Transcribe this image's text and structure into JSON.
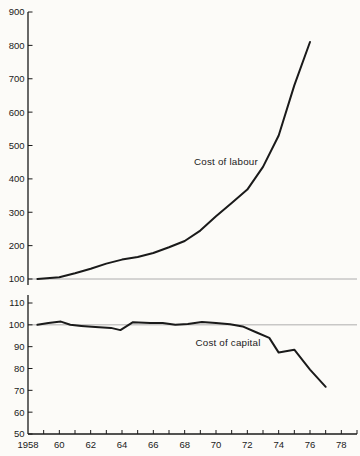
{
  "figure": {
    "background_color": "#fcfbf8",
    "line_color": "#1a1a1a",
    "reference_line_color": "#9b9b9b",
    "text_color": "#1a1a1a"
  },
  "chart_data": [
    {
      "type": "line",
      "panel": "top",
      "series_label": "Cost of labour",
      "ylim": [
        100,
        900
      ],
      "yticks": [
        100,
        200,
        300,
        400,
        500,
        600,
        700,
        800,
        900
      ],
      "reference_line": 100,
      "points": [
        [
          1958.6,
          100
        ],
        [
          1960,
          105
        ],
        [
          1961,
          117
        ],
        [
          1962,
          131
        ],
        [
          1963,
          146
        ],
        [
          1964,
          158
        ],
        [
          1965,
          166
        ],
        [
          1966,
          178
        ],
        [
          1967,
          195
        ],
        [
          1968,
          214
        ],
        [
          1969,
          245
        ],
        [
          1970,
          288
        ],
        [
          1971,
          328
        ],
        [
          1972,
          368
        ],
        [
          1973,
          436
        ],
        [
          1974,
          530
        ],
        [
          1975,
          680
        ],
        [
          1976,
          810
        ]
      ]
    },
    {
      "type": "line",
      "panel": "bottom",
      "series_label": "Cost of capital",
      "ylim": [
        50,
        110
      ],
      "yticks": [
        50,
        60,
        70,
        80,
        90,
        100,
        110
      ],
      "reference_line": 100,
      "points": [
        [
          1958.6,
          100
        ],
        [
          1959.3,
          100.8
        ],
        [
          1960.1,
          101.5
        ],
        [
          1960.7,
          100
        ],
        [
          1961.4,
          99.5
        ],
        [
          1962.3,
          99
        ],
        [
          1963.3,
          98.6
        ],
        [
          1963.9,
          97.6
        ],
        [
          1964.7,
          101.2
        ],
        [
          1965.8,
          100.8
        ],
        [
          1966.6,
          100.8
        ],
        [
          1967.4,
          100
        ],
        [
          1968.2,
          100.4
        ],
        [
          1969.1,
          101.3
        ],
        [
          1970,
          100.8
        ],
        [
          1970.9,
          100.3
        ],
        [
          1971.7,
          99.3
        ],
        [
          1972.6,
          96.5
        ],
        [
          1973.4,
          94
        ],
        [
          1974,
          87.3
        ],
        [
          1975,
          88.6
        ],
        [
          1976,
          79.5
        ],
        [
          1977,
          71.6
        ]
      ]
    }
  ],
  "x_axis": {
    "range": [
      1958,
      1979
    ],
    "tick_interval": 1,
    "labels": [
      {
        "text": "1958",
        "year": 1958
      },
      {
        "text": "60",
        "year": 1960
      },
      {
        "text": "62",
        "year": 1962
      },
      {
        "text": "64",
        "year": 1964
      },
      {
        "text": "66",
        "year": 1966
      },
      {
        "text": "68",
        "year": 1968
      },
      {
        "text": "70",
        "year": 1970
      },
      {
        "text": "72",
        "year": 1972
      },
      {
        "text": "74",
        "year": 1974
      },
      {
        "text": "76",
        "year": 1976
      },
      {
        "text": "78",
        "year": 1978
      }
    ]
  }
}
